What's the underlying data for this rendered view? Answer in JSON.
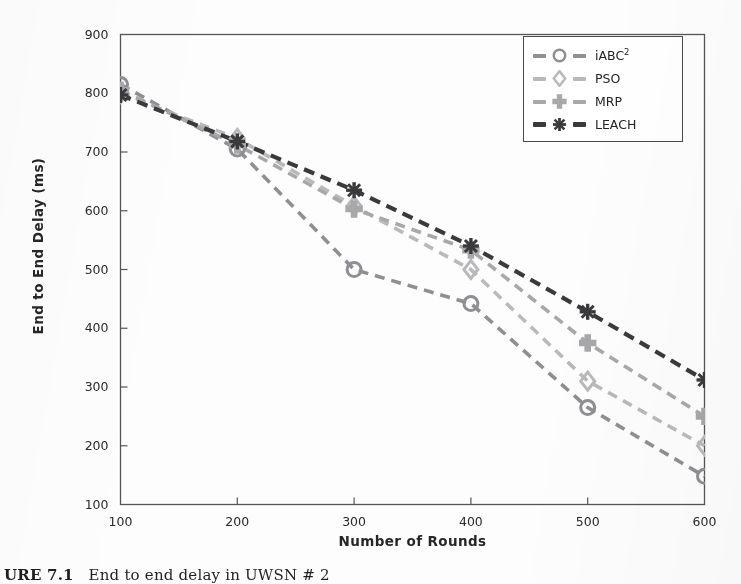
{
  "figure": {
    "caption_prefix": "URE 7.1",
    "caption_rest": "End to end delay in UWSN # 2",
    "caption_full": "URE 7.1   End to end delay in UWSN # 2"
  },
  "legend": {
    "position": "top-right",
    "entries": [
      {
        "label": "iABC",
        "superscript": "2",
        "marker": "circle-icon",
        "color": "#8e8e93"
      },
      {
        "label": "PSO",
        "superscript": "",
        "marker": "diamond-icon",
        "color": "#b9b9bb"
      },
      {
        "label": "MRP",
        "superscript": "",
        "marker": "plus-diamond-icon",
        "color": "#a8a8aa"
      },
      {
        "label": "LEACH",
        "superscript": "",
        "marker": "star-icon",
        "color": "#3a3a3c"
      }
    ]
  },
  "chart_data": {
    "type": "line",
    "title": "",
    "xlabel": "Number of Rounds",
    "ylabel": "End to End Delay (ms)",
    "x": [
      100,
      200,
      300,
      400,
      500,
      600
    ],
    "xlim": [
      100,
      600
    ],
    "ylim": [
      100,
      900
    ],
    "xticks": [
      100,
      200,
      300,
      400,
      500,
      600
    ],
    "yticks": [
      100,
      200,
      300,
      400,
      500,
      600,
      700,
      800,
      900
    ],
    "grid": false,
    "linestyle": "dashed",
    "legend_position": "upper right",
    "series": [
      {
        "name": "iABC2",
        "display_name": "iABC²",
        "marker": "circle",
        "color": "#8e8e93",
        "values": [
          815,
          705,
          500,
          442,
          265,
          148
        ]
      },
      {
        "name": "PSO",
        "display_name": "PSO",
        "marker": "diamond",
        "color": "#b9b9bb",
        "values": [
          800,
          723,
          608,
          500,
          310,
          200
        ]
      },
      {
        "name": "MRP",
        "display_name": "MRP",
        "marker": "plus-diamond",
        "color": "#a8a8aa",
        "values": [
          805,
          712,
          603,
          533,
          375,
          250
        ]
      },
      {
        "name": "LEACH",
        "display_name": "LEACH",
        "marker": "star",
        "color": "#3a3a3c",
        "values": [
          797,
          718,
          635,
          540,
          428,
          312
        ]
      }
    ]
  },
  "axes": {
    "x_tick_labels": [
      "100",
      "200",
      "300",
      "400",
      "500",
      "600"
    ],
    "y_tick_labels": [
      "100",
      "200",
      "300",
      "400",
      "500",
      "600",
      "700",
      "800",
      "900"
    ],
    "x_title": "Number of Rounds",
    "y_title": "End to End Delay (ms)"
  }
}
